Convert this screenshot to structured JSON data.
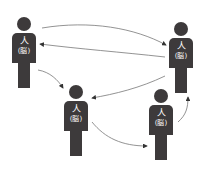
{
  "colors": {
    "figure": "#3d3a3b",
    "arrow": "#555555",
    "text": "#ffffff"
  },
  "figures": [
    {
      "id": "A",
      "label": "人",
      "sub": "(脳)"
    },
    {
      "id": "B",
      "label": "人",
      "sub": "(脳)"
    },
    {
      "id": "C",
      "label": "人",
      "sub": "(脳)"
    },
    {
      "id": "D",
      "label": "人",
      "sub": "(脳)"
    }
  ]
}
